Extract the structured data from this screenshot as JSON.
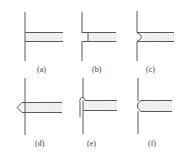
{
  "figure": {
    "panels": [
      {
        "id": "a",
        "label": "(a)",
        "joint": "plain butt to wall"
      },
      {
        "id": "b",
        "label": "(b)",
        "joint": "flat end cap inset"
      },
      {
        "id": "c",
        "label": "(c)",
        "joint": "concave rounded end"
      },
      {
        "id": "d",
        "label": "(d)",
        "joint": "pointed tip through wall"
      },
      {
        "id": "e",
        "label": "(e)",
        "joint": "flared lip at wall"
      },
      {
        "id": "f",
        "label": "(f)",
        "joint": "convex rounded end"
      }
    ],
    "colors": {
      "line": "#5a5a5a",
      "fill": "#f1f1ee",
      "stipple": "#b8b8b0"
    }
  }
}
